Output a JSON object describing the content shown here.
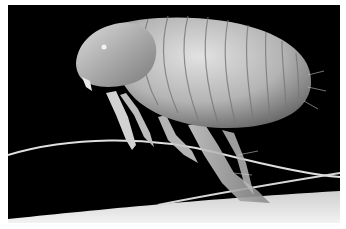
{
  "image": {
    "subject": "flea",
    "description": "Grayscale scanning electron micrograph of a flea perched on hair fibers against a black background",
    "colors": {
      "background": "#000000",
      "border": "#ffffff",
      "body_light": "#d9d9d9",
      "body_mid": "#a8a8a8",
      "body_dark": "#6e6e6e",
      "hair": "#e6e6e6"
    }
  }
}
